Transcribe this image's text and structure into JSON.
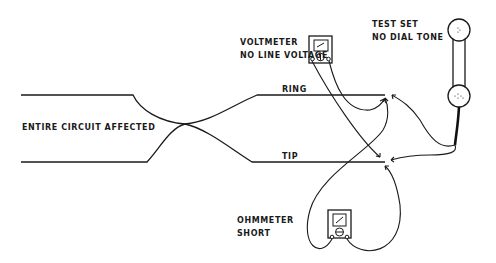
{
  "diagram": {
    "type": "telephone line fault diagram",
    "labels": {
      "circuit": "ENTIRE CIRCUIT AFFECTED",
      "voltmeter_line1": "VOLTMETER",
      "voltmeter_line2": "NO LINE VOLTAGE",
      "testset_line1": "TEST SET",
      "testset_line2": "NO DIAL TONE",
      "ring": "RING",
      "tip": "TIP",
      "ohmmeter_line1": "OHMMETER",
      "ohmmeter_line2": "SHORT"
    },
    "components": [
      {
        "name": "voltmeter",
        "reading": "NO LINE VOLTAGE"
      },
      {
        "name": "test set (handset)",
        "reading": "NO DIAL TONE"
      },
      {
        "name": "ohmmeter",
        "reading": "SHORT"
      }
    ],
    "conductors": [
      "RING",
      "TIP"
    ],
    "fault": "Ring and tip conductors crossed (shorted) — entire circuit affected",
    "colors": {
      "ink": "#1a1a1a",
      "background": "#ffffff"
    }
  }
}
